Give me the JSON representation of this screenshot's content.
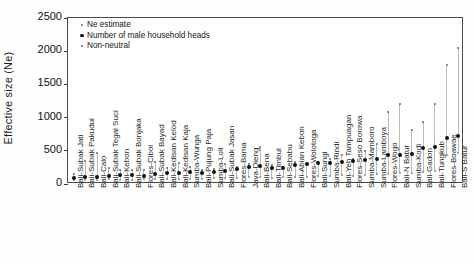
{
  "chart_data": {
    "type": "scatter",
    "title": "",
    "xlabel": "",
    "ylabel": "Effective size (Ne)",
    "ylim": [
      0,
      2500
    ],
    "yticks": [
      0,
      500,
      1000,
      1500,
      2000,
      2500
    ],
    "ytick_labels": [
      "0",
      "500",
      "1000",
      "1500",
      "2000",
      "2500"
    ],
    "grid": false,
    "legend_position": "top-left",
    "legend": [
      {
        "name": "Ne estimate",
        "marker": "small-dot"
      },
      {
        "name": "Number of male household heads",
        "marker": "large-dot"
      },
      {
        "name": "Non-neutral",
        "marker": "tiny-dot"
      }
    ],
    "categories": [
      "Bali-Subak Jati",
      "Bali-Subak Pakudui",
      "Bali-Calo",
      "Bali-Subak Tegal Suci",
      "Bali-Kebon",
      "Bali-Subak Bonjaka",
      "Flores-Cibol",
      "Bali-Subak Bayad",
      "Bali-Kedisan Kelod",
      "Bali-Kedisan Kaja",
      "Sumba-Wunga",
      "Bali-Pujung Paja",
      "Sumba-Loli",
      "Bali-Subak Jasan",
      "Flores-Bama",
      "Java-Dieng",
      "Bali-Bena",
      "Bali-Timbul",
      "Bali-Sebabu",
      "Bali-Abian Kebon",
      "Flores-Wolotoga",
      "Bali-Sungi",
      "Sumba-Rindi",
      "Bali-Yeh Tampuagan",
      "Flores-Seso Borowa",
      "Sumba-Mamboro",
      "Sumba-Lamboya",
      "Flores-Wogo",
      "Bali-N Batur",
      "Sumba-Kodi",
      "Bali-Gadon",
      "Bali-Tungkub",
      "Flores-Boawae",
      "Bali-S Batur"
    ],
    "series": [
      {
        "name": "Number of male household heads",
        "marker": "large-dot",
        "values": [
          95,
          105,
          110,
          120,
          140,
          135,
          125,
          150,
          160,
          165,
          175,
          170,
          180,
          195,
          230,
          250,
          265,
          245,
          235,
          290,
          300,
          310,
          320,
          330,
          345,
          360,
          370,
          430,
          440,
          455,
          540,
          560,
          690,
          720
        ]
      },
      {
        "name": "Ne estimate",
        "marker": "small-dot",
        "values": [
          150,
          340,
          470,
          235,
          210,
          215,
          205,
          330,
          245,
          320,
          250,
          215,
          230,
          300,
          260,
          295,
          560,
          290,
          255,
          330,
          290,
          330,
          370,
          440,
          380,
          500,
          600,
          1090,
          1200,
          820,
          930,
          1210,
          1790,
          2050
        ]
      },
      {
        "name": "Non-neutral",
        "marker": "tiny-dot",
        "values": [
          60,
          55,
          60,
          70,
          65,
          60,
          70,
          75,
          70,
          80,
          80,
          75,
          85,
          90,
          95,
          100,
          100,
          95,
          100,
          110,
          110,
          120,
          125,
          130,
          125,
          140,
          145,
          150,
          160,
          165,
          175,
          190,
          440,
          470
        ]
      }
    ]
  }
}
